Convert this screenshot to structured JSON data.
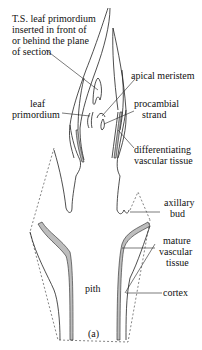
{
  "diagram": {
    "caption": "(a)",
    "labels": {
      "ts_leaf": [
        "T.S. leaf primordium",
        "inserted in front of",
        "or behind the plane",
        "of section"
      ],
      "apical_meristem": [
        "apical meristem"
      ],
      "leaf_primordium": [
        "leaf",
        "primordium"
      ],
      "procambial_strand": [
        "procambial",
        "strand"
      ],
      "differentiating_vascular": [
        "differentiating",
        "vascular tissue"
      ],
      "axillary_bud": [
        "axillary",
        "bud"
      ],
      "mature_vascular": [
        "mature",
        "vascular",
        "tissue"
      ],
      "pith": [
        "pith"
      ],
      "cortex": [
        "cortex"
      ]
    }
  }
}
